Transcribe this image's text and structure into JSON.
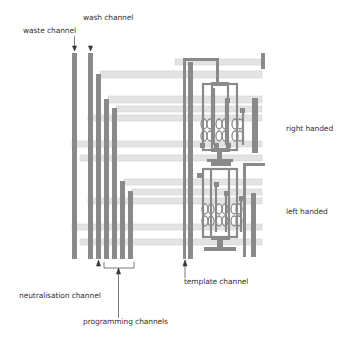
{
  "diagram": {
    "labels": {
      "waste_channel": "waste channel",
      "wash_channel": "wash channel",
      "right_handed": "right handed",
      "left_handed": "left handed",
      "neutralisation_channel": "neutralisation channel",
      "programming_channels": "programming channels",
      "template_channel": "template channel"
    },
    "colors": {
      "channel": "#8a8a8a",
      "band": "#e2e2e2",
      "band_edge": "#d0d0d0",
      "text": "#333333",
      "arrow": "#333333",
      "background": "#ffffff"
    },
    "vertical_channels": [
      {
        "name": "waste",
        "x": 73,
        "top": 53,
        "bottom": 258
      },
      {
        "name": "wash",
        "x": 89,
        "top": 53,
        "bottom": 258
      },
      {
        "name": "neutralisation",
        "x": 97,
        "top": 74,
        "bottom": 258
      },
      {
        "name": "programming-1",
        "x": 105,
        "top": 99,
        "bottom": 258
      },
      {
        "name": "programming-2",
        "x": 113,
        "top": 108,
        "bottom": 258
      },
      {
        "name": "programming-3",
        "x": 121,
        "top": 181,
        "bottom": 258
      },
      {
        "name": "programming-4",
        "x": 129,
        "top": 191,
        "bottom": 258
      }
    ],
    "horizontal_bands": [
      {
        "y": 62,
        "x1": 175,
        "x2": 262
      },
      {
        "y": 74,
        "x1": 100,
        "x2": 262
      },
      {
        "y": 99,
        "x1": 108,
        "x2": 262
      },
      {
        "y": 108,
        "x1": 116,
        "x2": 262
      },
      {
        "y": 117,
        "x1": 88,
        "x2": 262
      },
      {
        "y": 143,
        "x1": 72,
        "x2": 262
      },
      {
        "y": 157,
        "x1": 80,
        "x2": 262
      },
      {
        "y": 181,
        "x1": 124,
        "x2": 262
      },
      {
        "y": 191,
        "x1": 132,
        "x2": 262
      },
      {
        "y": 200,
        "x1": 88,
        "x2": 262
      },
      {
        "y": 226,
        "x1": 72,
        "x2": 262
      },
      {
        "y": 241,
        "x1": 80,
        "x2": 262
      }
    ]
  }
}
